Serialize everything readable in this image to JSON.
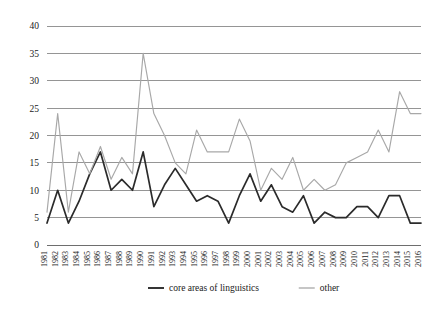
{
  "chart_data": {
    "type": "line",
    "title": "",
    "xlabel": "",
    "ylabel": "",
    "ylim": [
      0,
      40
    ],
    "ytick_step": 5,
    "yticks": [
      "0",
      "5",
      "10",
      "15",
      "20",
      "25",
      "30",
      "35",
      "40"
    ],
    "grid": true,
    "legend_position": "bottom-center",
    "categories": [
      "1981",
      "1982",
      "1983",
      "1984",
      "1985",
      "1986",
      "1987",
      "1988",
      "1989",
      "1990",
      "1991",
      "1992",
      "1993",
      "1994",
      "1995",
      "1996",
      "1997",
      "1998",
      "1999",
      "2000",
      "2001",
      "2002",
      "2003",
      "2004",
      "2005",
      "2006",
      "2007",
      "2008",
      "2009",
      "2010",
      "2011",
      "2012",
      "2013",
      "2014",
      "2015",
      "2016"
    ],
    "series": [
      {
        "name": "core areas of linguistics",
        "color": "#2b2b2b",
        "values": [
          4,
          10,
          4,
          8,
          13,
          17,
          10,
          12,
          10,
          17,
          7,
          11,
          14,
          11,
          8,
          9,
          8,
          4,
          9,
          13,
          8,
          11,
          7,
          6,
          9,
          4,
          6,
          5,
          5,
          7,
          7,
          5,
          9,
          9,
          4,
          4
        ]
      },
      {
        "name": "other",
        "color": "#a8a8a8",
        "values": [
          6,
          24,
          6,
          17,
          13,
          18,
          12,
          16,
          13,
          35,
          24,
          20,
          15,
          13,
          21,
          17,
          17,
          17,
          23,
          19,
          10,
          14,
          12,
          16,
          10,
          12,
          10,
          11,
          15,
          16,
          17,
          21,
          17,
          28,
          24,
          24
        ]
      }
    ],
    "legend": [
      {
        "label": "core areas of linguistics",
        "color": "#2b2b2b"
      },
      {
        "label": "other",
        "color": "#a8a8a8"
      }
    ]
  }
}
